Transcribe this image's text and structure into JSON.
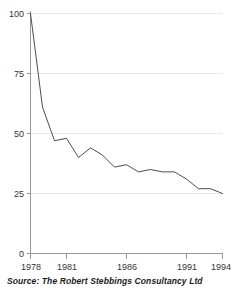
{
  "chart_data": {
    "type": "line",
    "title": "",
    "subtitle": "",
    "xlabel": "",
    "ylabel": "",
    "x": [
      1978,
      1979,
      1980,
      1981,
      1982,
      1983,
      1984,
      1985,
      1986,
      1987,
      1988,
      1989,
      1990,
      1991,
      1992,
      1993,
      1994
    ],
    "values": [
      100,
      61,
      47,
      48,
      40,
      44,
      41,
      36,
      37,
      34,
      35,
      34,
      34,
      31,
      27,
      27,
      25
    ],
    "series": [
      {
        "name": "index",
        "values": [
          100,
          61,
          47,
          48,
          40,
          44,
          41,
          36,
          37,
          34,
          35,
          34,
          34,
          31,
          27,
          27,
          25
        ]
      }
    ],
    "xlim": [
      1978,
      1994
    ],
    "ylim": [
      0,
      100
    ],
    "ytick_labels": [
      "100",
      "75",
      "50",
      "25",
      "0"
    ],
    "ytick_values": [
      100,
      75,
      50,
      25,
      0
    ],
    "xtick_labels": [
      "1978",
      "1981",
      "1986",
      "1991",
      "1994"
    ],
    "xtick_values": [
      1978,
      1981,
      1986,
      1991,
      1994
    ],
    "grid": "horizontal",
    "legend": "none",
    "line_color": "#4d4d4d",
    "grid_color": "#e8e8e8",
    "axis_color": "#9a9a9a"
  },
  "footer": {
    "source_text": "Source: The Robert Stebbings Consultancy Ltd"
  }
}
